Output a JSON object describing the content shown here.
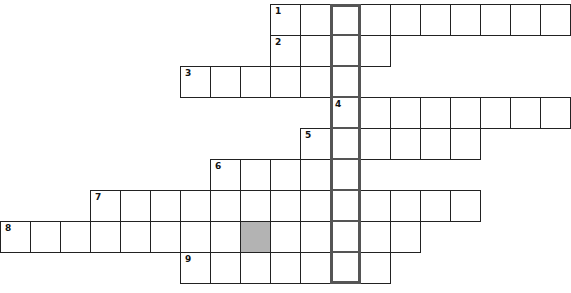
{
  "puzzle": {
    "type": "crossword",
    "cell_width": 30,
    "cell_height": 31,
    "origin_x": 1,
    "origin_y": 4,
    "key_column": 11,
    "key_column_border_color": "#555555",
    "shaded_color": "#b3b3b3",
    "rows": [
      {
        "number": "1",
        "start_col": 9,
        "length": 10,
        "shaded": []
      },
      {
        "number": "2",
        "start_col": 9,
        "length": 4,
        "shaded": []
      },
      {
        "number": "3",
        "start_col": 6,
        "length": 6,
        "shaded": []
      },
      {
        "number": "4",
        "start_col": 11,
        "length": 8,
        "shaded": []
      },
      {
        "number": "5",
        "start_col": 10,
        "length": 6,
        "shaded": []
      },
      {
        "number": "6",
        "start_col": 7,
        "length": 5,
        "shaded": []
      },
      {
        "number": "7",
        "start_col": 3,
        "length": 13,
        "shaded": []
      },
      {
        "number": "8",
        "start_col": 0,
        "length": 14,
        "shaded": [
          8
        ]
      },
      {
        "number": "9",
        "start_col": 6,
        "length": 7,
        "shaded": []
      }
    ]
  }
}
